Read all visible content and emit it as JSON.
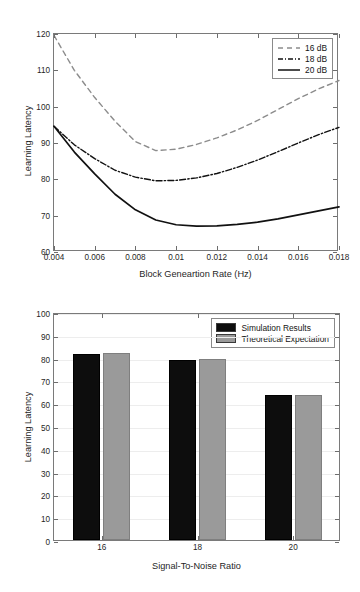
{
  "chart_data": [
    {
      "type": "line",
      "title": "",
      "xlabel": "Block Geneartion Rate (Hz)",
      "ylabel": "Learning Latency",
      "xlim": [
        0.004,
        0.018
      ],
      "ylim": [
        60,
        120
      ],
      "xticks": [
        "0.004",
        "0.006",
        "0.008",
        "0.01",
        "0.012",
        "0.014",
        "0.016",
        "0.018"
      ],
      "xtick_values": [
        0.004,
        0.006,
        0.008,
        0.01,
        0.012,
        0.014,
        0.016,
        0.018
      ],
      "yticks": [
        "60",
        "70",
        "80",
        "90",
        "100",
        "110",
        "120"
      ],
      "ytick_values": [
        60,
        70,
        80,
        90,
        100,
        110,
        120
      ],
      "grid": false,
      "legend_position": "upper right",
      "x": [
        0.004,
        0.005,
        0.006,
        0.007,
        0.008,
        0.009,
        0.01,
        0.011,
        0.012,
        0.013,
        0.014,
        0.015,
        0.016,
        0.017,
        0.018
      ],
      "series": [
        {
          "name": "16 dB",
          "style": "dashed",
          "color": "#8c8c8c",
          "values": [
            119.6,
            110.0,
            102.5,
            96.0,
            90.4,
            87.9,
            88.3,
            89.6,
            91.4,
            93.6,
            96.2,
            99.2,
            102.2,
            104.9,
            107.2
          ]
        },
        {
          "name": "18 dB",
          "style": "dash-dot",
          "color": "#111111",
          "values": [
            94.6,
            89.5,
            85.7,
            82.5,
            80.6,
            79.6,
            79.7,
            80.4,
            81.6,
            83.3,
            85.3,
            87.6,
            90.0,
            92.3,
            94.3
          ]
        },
        {
          "name": "20 dB",
          "style": "solid",
          "color": "#111111",
          "values": [
            94.6,
            87.5,
            81.5,
            75.9,
            71.6,
            68.8,
            67.5,
            67.1,
            67.2,
            67.6,
            68.2,
            69.1,
            70.2,
            71.3,
            72.4
          ]
        }
      ]
    },
    {
      "type": "bar",
      "title": "",
      "xlabel": "Signal-To-Noise Ratio",
      "ylabel": "Learning Latency",
      "categories": [
        "16",
        "18",
        "20"
      ],
      "ylim": [
        0,
        100
      ],
      "yticks": [
        "0",
        "10",
        "20",
        "30",
        "40",
        "50",
        "60",
        "70",
        "80",
        "90",
        "100"
      ],
      "ytick_values": [
        0,
        10,
        20,
        30,
        40,
        50,
        60,
        70,
        80,
        90,
        100
      ],
      "grid": false,
      "legend_position": "upper right",
      "series": [
        {
          "name": "Simulation Results",
          "color": "#0d0d0d",
          "values": [
            81.8,
            79.0,
            63.4
          ]
        },
        {
          "name": "Theoretical Expectation",
          "color": "#9a9a9a",
          "values": [
            82.2,
            79.3,
            63.7
          ]
        }
      ]
    }
  ]
}
